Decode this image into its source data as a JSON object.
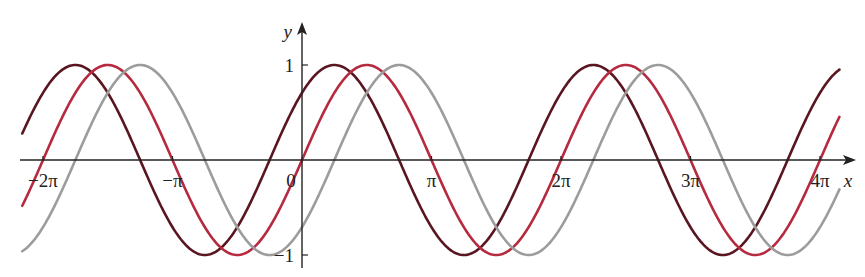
{
  "chart_data": {
    "type": "line",
    "title": "",
    "xlabel": "x",
    "ylabel": "y",
    "x_range": [
      -2.16,
      4.15
    ],
    "x_units": "multiples of pi",
    "ylim": [
      -1,
      1
    ],
    "grid": false,
    "legend": null,
    "x_ticks": [
      {
        "value": -2,
        "label": "−2π"
      },
      {
        "value": -1,
        "label": "−π"
      },
      {
        "value": 0,
        "label": "0"
      },
      {
        "value": 1,
        "label": "π"
      },
      {
        "value": 2,
        "label": "2π"
      },
      {
        "value": 3,
        "label": "3π"
      },
      {
        "value": 4,
        "label": "4π"
      }
    ],
    "y_ticks": [
      {
        "value": 1,
        "label": "1"
      },
      {
        "value": -1,
        "label": "−1"
      }
    ],
    "series": [
      {
        "name": "y = sin(x + π/4)",
        "phase_shift_pi": -0.25,
        "amplitude": 1,
        "color": "#5a1620"
      },
      {
        "name": "y = sin(x)",
        "phase_shift_pi": 0,
        "amplitude": 1,
        "color": "#b52a3e"
      },
      {
        "name": "y = sin(x − π/4)",
        "phase_shift_pi": 0.25,
        "amplitude": 1,
        "color": "#9c9c9c"
      }
    ]
  },
  "axis_color": "#222222"
}
